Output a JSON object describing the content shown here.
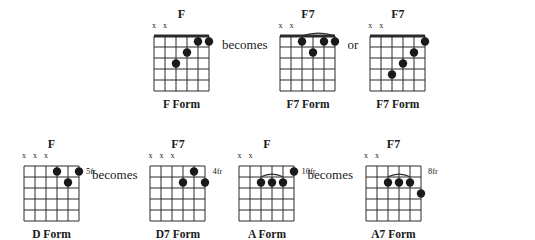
{
  "page": {
    "connector_becomes": "becomes",
    "connector_or": "or",
    "muted_symbol": "x"
  },
  "rows": [
    {
      "id": "row-top",
      "groups": [
        {
          "chords": [
            {
              "name": "F",
              "form_label": "F Form",
              "fret_label": "",
              "nut": true,
              "muted_strings": [
                1,
                2
              ],
              "dots": [
                {
                  "string": 3,
                  "fret": 3
                },
                {
                  "string": 4,
                  "fret": 2
                },
                {
                  "string": 5,
                  "fret": 1
                },
                {
                  "string": 6,
                  "fret": 1
                }
              ],
              "barre": null
            }
          ],
          "connector_after": "becomes"
        },
        {
          "chords": [
            {
              "name": "F7",
              "form_label": "F7 Form",
              "fret_label": "",
              "nut": true,
              "muted_strings": [
                1,
                2
              ],
              "dots": [
                {
                  "string": 3,
                  "fret": 1
                },
                {
                  "string": 4,
                  "fret": 2
                },
                {
                  "string": 5,
                  "fret": 1
                },
                {
                  "string": 6,
                  "fret": 1
                }
              ],
              "barre": {
                "fret": 1,
                "from_string": 3,
                "to_string": 6
              }
            }
          ],
          "connector_after": "or"
        },
        {
          "chords": [
            {
              "name": "F7",
              "form_label": "F7 Form",
              "fret_label": "",
              "nut": true,
              "muted_strings": [
                1,
                2
              ],
              "dots": [
                {
                  "string": 3,
                  "fret": 4
                },
                {
                  "string": 4,
                  "fret": 3
                },
                {
                  "string": 5,
                  "fret": 2
                },
                {
                  "string": 6,
                  "fret": 1
                }
              ],
              "barre": null
            }
          ],
          "connector_after": ""
        }
      ]
    },
    {
      "id": "row-bottom",
      "groups": [
        {
          "chords": [
            {
              "name": "F",
              "form_label": "D Form",
              "fret_label": "5fr",
              "nut": false,
              "muted_strings": [
                1,
                2,
                3
              ],
              "dots": [
                {
                  "string": 4,
                  "fret": 1
                },
                {
                  "string": 5,
                  "fret": 2
                },
                {
                  "string": 6,
                  "fret": 1
                }
              ],
              "barre": null
            }
          ],
          "connector_after": "becomes"
        },
        {
          "chords": [
            {
              "name": "F7",
              "form_label": "D7 Form",
              "fret_label": "4fr",
              "nut": false,
              "muted_strings": [
                1,
                2,
                3
              ],
              "dots": [
                {
                  "string": 4,
                  "fret": 2
                },
                {
                  "string": 5,
                  "fret": 1
                },
                {
                  "string": 6,
                  "fret": 2
                }
              ],
              "barre": null
            }
          ],
          "connector_after": ""
        },
        {
          "chords": [
            {
              "name": "F",
              "form_label": "A Form",
              "fret_label": "10fr",
              "nut": false,
              "muted_strings": [
                1,
                2
              ],
              "dots": [
                {
                  "string": 3,
                  "fret": 2
                },
                {
                  "string": 4,
                  "fret": 2
                },
                {
                  "string": 5,
                  "fret": 2
                },
                {
                  "string": 6,
                  "fret": 1
                }
              ],
              "barre": {
                "fret": 2,
                "from_string": 3,
                "to_string": 5
              }
            }
          ],
          "connector_after": "becomes"
        },
        {
          "chords": [
            {
              "name": "F7",
              "form_label": "A7 Form",
              "fret_label": "8fr",
              "nut": false,
              "muted_strings": [
                1,
                2
              ],
              "dots": [
                {
                  "string": 3,
                  "fret": 2
                },
                {
                  "string": 4,
                  "fret": 2
                },
                {
                  "string": 5,
                  "fret": 2
                },
                {
                  "string": 6,
                  "fret": 3
                }
              ],
              "barre": {
                "fret": 2,
                "from_string": 3,
                "to_string": 5
              }
            }
          ],
          "connector_after": ""
        }
      ]
    }
  ],
  "diagram_geometry": {
    "strings": 6,
    "frets": 5,
    "string_spacing": 11,
    "fret_spacing": 11,
    "dot_radius": 4.2,
    "line_color": "#2b2b2b",
    "dot_color": "#1a1a1a"
  }
}
